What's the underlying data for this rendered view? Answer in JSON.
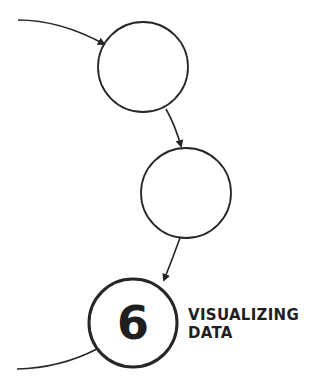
{
  "diagram": {
    "nodes": [
      {
        "id": "step-4",
        "label": ""
      },
      {
        "id": "step-5",
        "label": ""
      },
      {
        "id": "step-6",
        "number": "6",
        "title_line1": "VISUALIZING",
        "title_line2": "DATA"
      }
    ],
    "edges": [
      {
        "from": "previous",
        "to": "step-4"
      },
      {
        "from": "step-4",
        "to": "step-5"
      },
      {
        "from": "step-5",
        "to": "step-6"
      },
      {
        "from": "step-6",
        "to": "next"
      }
    ],
    "stroke_color": "#262626"
  }
}
